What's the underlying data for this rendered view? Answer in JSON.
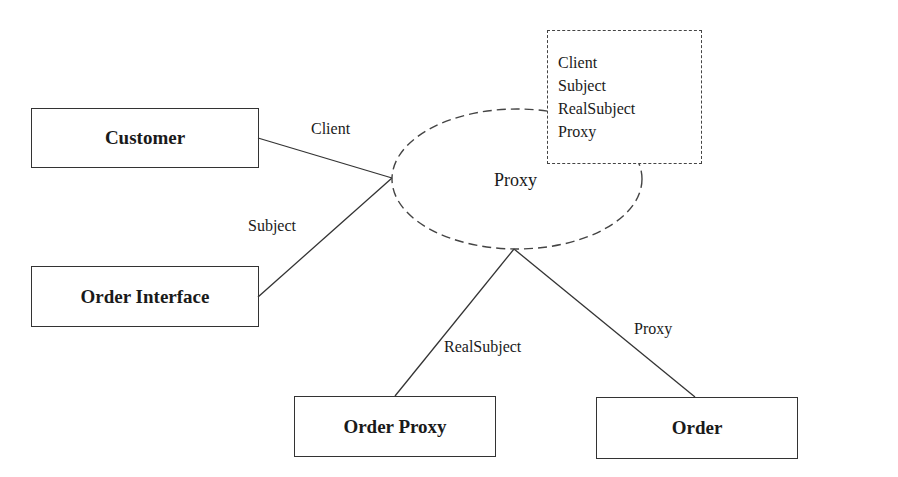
{
  "diagram": {
    "collaboration": {
      "name": "Proxy",
      "participants": [
        "Client",
        "Subject",
        "RealSubject",
        "Proxy"
      ]
    },
    "classes": [
      {
        "id": "customer",
        "label": "Customer"
      },
      {
        "id": "order-interface",
        "label": "Order Interface"
      },
      {
        "id": "order-proxy",
        "label": "Order Proxy"
      },
      {
        "id": "order",
        "label": "Order"
      }
    ],
    "roles": [
      {
        "from": "customer",
        "to": "Proxy",
        "label": "Client"
      },
      {
        "from": "order-interface",
        "to": "Proxy",
        "label": "Subject"
      },
      {
        "from": "order-proxy",
        "to": "Proxy",
        "label": "RealSubject"
      },
      {
        "from": "order",
        "to": "Proxy",
        "label": "Proxy"
      }
    ],
    "colors": {
      "line": "#333333",
      "text": "#1a1a1a",
      "background": "#ffffff"
    }
  }
}
